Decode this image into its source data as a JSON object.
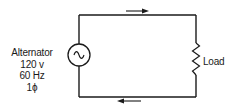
{
  "diagram": {
    "type": "single-phase AC circuit",
    "source": {
      "name": "Alternator",
      "voltage": "120 v",
      "frequency": "60 Hz",
      "phase": "1ϕ",
      "symbol": "ac-sine-wave"
    },
    "load": {
      "label": "Load",
      "symbol": "resistor-zigzag"
    },
    "arrows": {
      "top": "right",
      "bottom": "left"
    },
    "colors": {
      "line": "#1a1a1a",
      "background": "#ffffff"
    }
  }
}
